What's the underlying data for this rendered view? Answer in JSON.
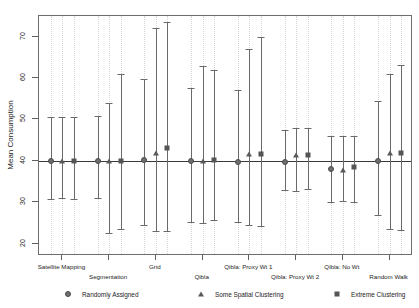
{
  "chart_data": {
    "type": "scatter",
    "title": "",
    "subtitle": "",
    "xlabel": "",
    "ylabel": "Mean Consumption",
    "ylim": [
      17,
      75
    ],
    "yticks": [
      20,
      30,
      40,
      50,
      60,
      70
    ],
    "ytick_labels": [
      "20",
      "30",
      "40",
      "50",
      "60",
      "70"
    ],
    "grid": "vertical-dotted",
    "reference_line": 40,
    "legend_position": "bottom",
    "legend": [
      {
        "label": "Randomly Assigned",
        "marker": "circle"
      },
      {
        "label": "Some Spatial Clustering",
        "marker": "triangle"
      },
      {
        "label": "Extreme Clustering",
        "marker": "square"
      }
    ],
    "categories": [
      "Satellite Mapping",
      "Segmentation",
      "Grid",
      "Qibla",
      "Qibla: Proxy Wt 1",
      "Qibla: Proxy Wt 2",
      "Qibla: No Wt",
      "Random Walk"
    ],
    "series": [
      {
        "name": "Randomly Assigned",
        "marker": "circle",
        "points": [
          {
            "category": "Satellite Mapping",
            "estimate": 40.0,
            "low": 30.8,
            "high": 50.6
          },
          {
            "category": "Segmentation",
            "estimate": 40.0,
            "low": 31.0,
            "high": 50.8
          },
          {
            "category": "Grid",
            "estimate": 40.1,
            "low": 24.4,
            "high": 59.8
          },
          {
            "category": "Qibla",
            "estimate": 39.9,
            "low": 25.1,
            "high": 57.5
          },
          {
            "category": "Qibla: Proxy Wt 1",
            "estimate": 39.8,
            "low": 25.3,
            "high": 57.0
          },
          {
            "category": "Qibla: Proxy Wt 2",
            "estimate": 39.7,
            "low": 33.0,
            "high": 47.4
          },
          {
            "category": "Qibla: No Wt",
            "estimate": 38.0,
            "low": 30.0,
            "high": 46.0
          },
          {
            "category": "Random Walk",
            "estimate": 40.0,
            "low": 27.0,
            "high": 54.5
          }
        ]
      },
      {
        "name": "Some Spatial Clustering",
        "marker": "triangle",
        "points": [
          {
            "category": "Satellite Mapping",
            "estimate": 40.0,
            "low": 30.9,
            "high": 50.7
          },
          {
            "category": "Segmentation",
            "estimate": 40.0,
            "low": 22.6,
            "high": 53.9
          },
          {
            "category": "Grid",
            "estimate": 42.0,
            "low": 23.0,
            "high": 72.0
          },
          {
            "category": "Qibla",
            "estimate": 40.0,
            "low": 25.0,
            "high": 62.9
          },
          {
            "category": "Qibla: Proxy Wt 1",
            "estimate": 41.7,
            "low": 24.4,
            "high": 67.0
          },
          {
            "category": "Qibla: Proxy Wt 2",
            "estimate": 41.5,
            "low": 32.6,
            "high": 47.9
          },
          {
            "category": "Qibla: No Wt",
            "estimate": 37.9,
            "low": 30.4,
            "high": 45.9
          },
          {
            "category": "Random Walk",
            "estimate": 42.0,
            "low": 23.6,
            "high": 60.9
          }
        ]
      },
      {
        "name": "Extreme Clustering",
        "marker": "square",
        "points": [
          {
            "category": "Satellite Mapping",
            "estimate": 40.0,
            "low": 30.8,
            "high": 50.7
          },
          {
            "category": "Segmentation",
            "estimate": 40.0,
            "low": 23.6,
            "high": 60.9
          },
          {
            "category": "Grid",
            "estimate": 43.2,
            "low": 23.1,
            "high": 73.6
          },
          {
            "category": "Qibla",
            "estimate": 40.1,
            "low": 25.6,
            "high": 62.0
          },
          {
            "category": "Qibla: Proxy Wt 1",
            "estimate": 41.7,
            "low": 24.2,
            "high": 70.0
          },
          {
            "category": "Qibla: Proxy Wt 2",
            "estimate": 41.4,
            "low": 33.1,
            "high": 47.9
          },
          {
            "category": "Qibla: No Wt",
            "estimate": 38.4,
            "low": 30.1,
            "high": 46.0
          },
          {
            "category": "Random Walk",
            "estimate": 41.8,
            "low": 23.4,
            "high": 63.1
          }
        ]
      }
    ]
  }
}
